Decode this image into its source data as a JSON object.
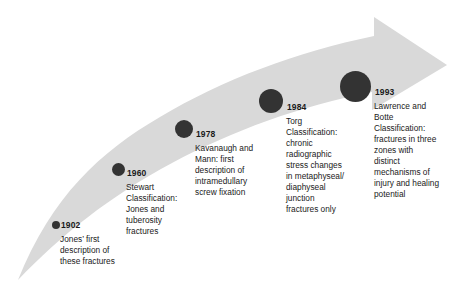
{
  "diagram": {
    "type": "timeline-arrow",
    "arrow": {
      "name": "curved-upward-arrow",
      "color": "#d9d9d9",
      "direction": "left-bottom to right-top"
    },
    "dot_color": "#333333",
    "text_color": "#1a1a1a",
    "milestones": [
      {
        "year": "1902",
        "description": "Jones’ first description of these fractures",
        "dot_size": 8
      },
      {
        "year": "1960",
        "description": "Stewart Classification: Jones and tuberosity fractures",
        "dot_size": 13
      },
      {
        "year": "1978",
        "description": "Kavanaugh and Mann: first description of intramedullary screw fixation",
        "dot_size": 18
      },
      {
        "year": "1984",
        "description": "Torg Classification: chronic radiographic stress changes in metaphyseal/ diaphyseal junction fractures only",
        "dot_size": 24
      },
      {
        "year": "1993",
        "description": "Lawrence and Botte Classification: fractures in three zones with distinct mechanisms of injury and healing potential",
        "dot_size": 31
      }
    ]
  }
}
